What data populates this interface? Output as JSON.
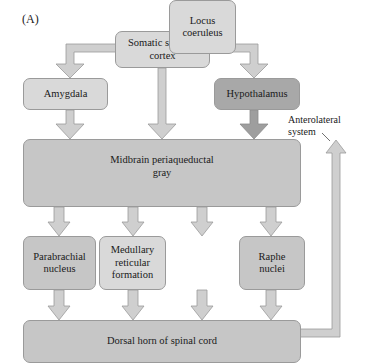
{
  "panel_label": "(A)",
  "nodes": {
    "somatic_sensory_cortex": {
      "line1": "Somatic sensory",
      "line2": "cortex"
    },
    "amygdala": {
      "label": "Amygdala"
    },
    "hypothalamus": {
      "label": "Hypothalamus"
    },
    "midbrain_pag": {
      "line1": "Midbrain periaqueductal",
      "line2": "gray"
    },
    "parabrachial": {
      "line1": "Parabrachial",
      "line2": "nucleus"
    },
    "medullary": {
      "line1": "Medullary",
      "line2": "reticular",
      "line3": "formation"
    },
    "locus": {
      "line1": "Locus",
      "line2": "coeruleus"
    },
    "raphe": {
      "line1": "Raphe",
      "line2": "nuclei"
    },
    "dorsal_horn": {
      "label": "Dorsal horn of spinal cord"
    }
  },
  "annotation": {
    "line1": "Anterolateral",
    "line2": "system"
  },
  "colors": {
    "light": "#d9d9d9",
    "mid": "#c6c6c6",
    "dark": "#a8a8a8",
    "arrow": "#cfcfcf",
    "arrow_dark": "#9e9e9e",
    "stroke": "#9a9a9a"
  }
}
